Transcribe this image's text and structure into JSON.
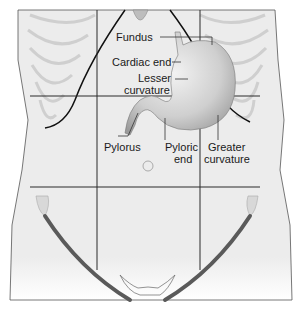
{
  "diagram": {
    "labels": {
      "fundus": "Fundus",
      "cardiac_end": "Cardiac end",
      "lesser_curvature_1": "Lesser",
      "lesser_curvature_2": "curvature",
      "pylorus": "Pylorus",
      "pyloric_end_1": "Pyloric",
      "pyloric_end_2": "end",
      "greater_curvature_1": "Greater",
      "greater_curvature_2": "curvature"
    },
    "colors": {
      "skin": "#ececec",
      "outline": "#1a1a1a",
      "grid": "#2a2a2a",
      "stomach": "#c8c8c8",
      "ribs": "#cfcfcf",
      "inguinal": "#5a5a5a"
    }
  }
}
